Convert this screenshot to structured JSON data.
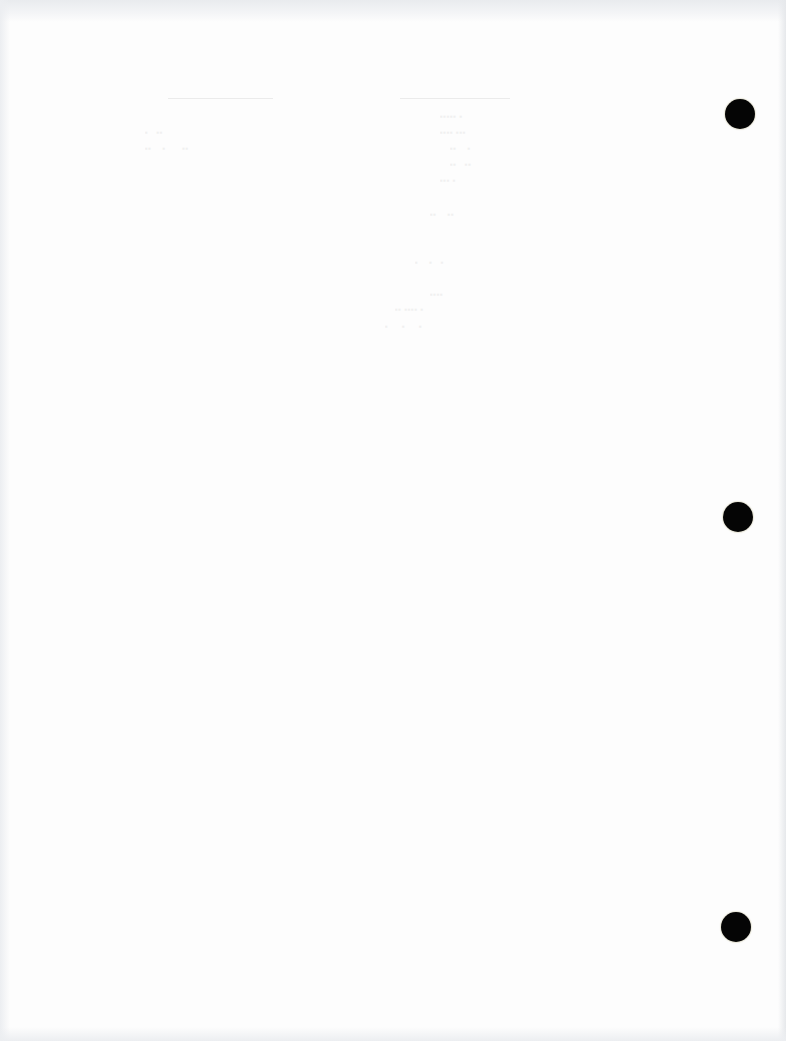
{
  "document": {
    "type": "scanned-page",
    "content": "blank page with faint illegible bleed-through text",
    "background_color": "#fdfdfd",
    "edge_color": "#e9ebee",
    "punch_hole_color": "#050505",
    "punch_holes": [
      {
        "position": "top",
        "center_x": 740,
        "center_y": 114
      },
      {
        "position": "middle",
        "center_x": 738,
        "center_y": 517
      },
      {
        "position": "bottom",
        "center_x": 736,
        "center_y": 927
      }
    ]
  }
}
